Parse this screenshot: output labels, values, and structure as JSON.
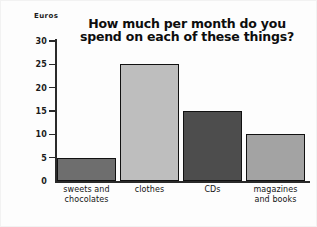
{
  "chart_data": {
    "type": "bar",
    "title": "How much per month do you spend on each of these things?",
    "title_line1": "How much per month do you",
    "title_line2": "spend on each of these things?",
    "xlabel": "",
    "ylabel": "Euros",
    "categories": [
      "sweets and chocolates",
      "clothes",
      "CDs",
      "magazines and books"
    ],
    "values": [
      5,
      25,
      15,
      10
    ],
    "ylim": [
      0,
      30
    ],
    "yticks": [
      0,
      5,
      10,
      15,
      20,
      25,
      30
    ],
    "ytick_labels": [
      "0",
      "5",
      "10",
      "15",
      "20",
      "25",
      "30"
    ],
    "grid": false,
    "legend": false,
    "bars": [
      {
        "label_line1": "sweets and",
        "label_line2": "chocolates",
        "value": 5,
        "fill": "#6e6e6e",
        "border": "#111111"
      },
      {
        "label_line1": "clothes",
        "label_line2": "",
        "value": 25,
        "fill": "#bebebe",
        "border": "#111111"
      },
      {
        "label_line1": "CDs",
        "label_line2": "",
        "value": 15,
        "fill": "#4d4d4d",
        "border": "#111111"
      },
      {
        "label_line1": "magazines",
        "label_line2": "and books",
        "value": 10,
        "fill": "#a3a3a3",
        "border": "#111111"
      }
    ],
    "axis_color": "#2a2a2a",
    "background": "#fdfdfd"
  }
}
